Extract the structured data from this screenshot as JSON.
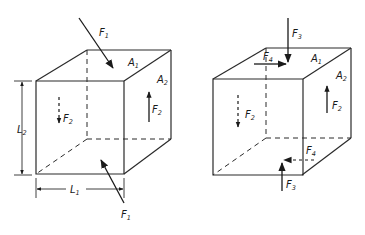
{
  "figure": {
    "left_cube": {
      "labels": {
        "F1_top": {
          "main": "F",
          "sub": "1"
        },
        "F1_bottom": {
          "main": "F",
          "sub": "1"
        },
        "A1": {
          "main": "A",
          "sub": "1"
        },
        "A2": {
          "main": "A",
          "sub": "2"
        },
        "F2_front": {
          "main": "F",
          "sub": "2"
        },
        "F2_side": {
          "main": "F",
          "sub": "2"
        },
        "L1": {
          "main": "L",
          "sub": "1"
        },
        "L2": {
          "main": "L",
          "sub": "2"
        }
      }
    },
    "right_cube": {
      "labels": {
        "F3_top": {
          "main": "F",
          "sub": "3"
        },
        "F3_bottom": {
          "main": "F",
          "sub": "3"
        },
        "F4_top": {
          "main": "F",
          "sub": "4"
        },
        "F4_bottom": {
          "main": "F",
          "sub": "4"
        },
        "A1": {
          "main": "A",
          "sub": "1"
        },
        "A2": {
          "main": "A",
          "sub": "2"
        },
        "F2_front": {
          "main": "F",
          "sub": "2"
        },
        "F2_side": {
          "main": "F",
          "sub": "2"
        }
      }
    },
    "connector": {
      "style": "dashed",
      "colors": [
        "#2a2a2a",
        "#8a8a40",
        "#6a6ac8"
      ]
    }
  }
}
